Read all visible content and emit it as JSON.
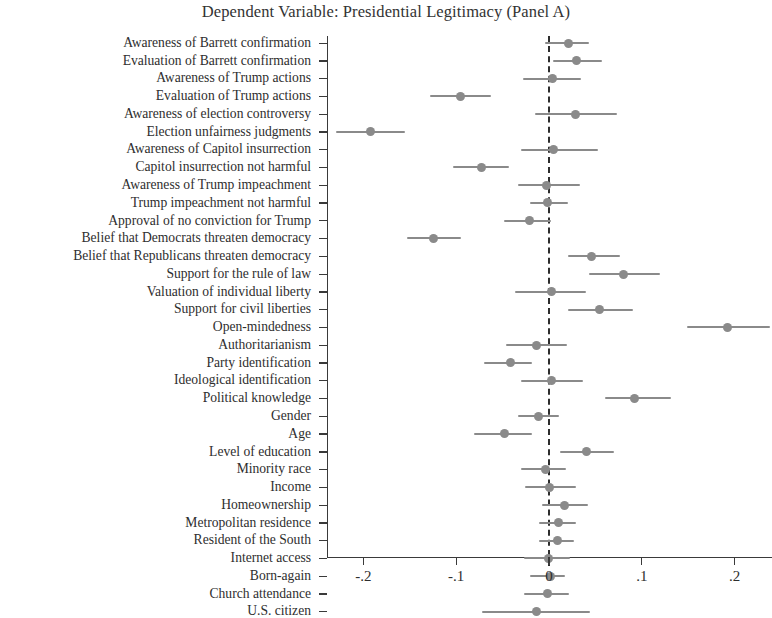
{
  "chart_data": {
    "type": "scatter",
    "title": "Dependent Variable: Presidential Legitimacy (Panel A)",
    "subtitle": "",
    "xlabel": "",
    "ylabel": "",
    "xlim": [
      -0.245,
      0.243
    ],
    "grid": false,
    "legend": null,
    "orientation": "horizontal",
    "reference_line": {
      "value": 0,
      "style": "dashed",
      "color": "#2d2d2d"
    },
    "marker_color": "#8a8a8a",
    "xticks": [
      -0.2,
      -0.1,
      0,
      0.1,
      0.2
    ],
    "xticklabels": [
      "-.2",
      "-.1",
      "0",
      ".1",
      ".2"
    ],
    "categories": [
      "Awareness of Barrett confirmation",
      "Evaluation of Barrett confirmation",
      "Awareness of Trump actions",
      "Evaluation of Trump actions",
      "Awareness of election controversy",
      "Election unfairness judgments",
      "Awareness of Capitol insurrection",
      "Capitol insurrection not harmful",
      "Awareness of Trump impeachment",
      "Trump impeachment not harmful",
      "Approval of no conviction for Trump",
      "Belief that Democrats threaten democracy",
      "Belief that Republicans threaten democracy",
      "Support for the rule of law",
      "Valuation of individual liberty",
      "Support for civil liberties",
      "Open-mindedness",
      "Authoritarianism",
      "Party identification",
      "Ideological identification",
      "Political knowledge",
      "Gender",
      "Age",
      "Level of education",
      "Minority race",
      "Income",
      "Homeownership",
      "Metropolitan residence",
      "Resident of the South",
      "Internet access",
      "Born-again",
      "Church attendance",
      "U.S. citizen"
    ],
    "values": [
      0.021,
      0.03,
      0.004,
      -0.095,
      0.029,
      -0.192,
      0.005,
      -0.073,
      -0.003,
      -0.002,
      -0.021,
      -0.124,
      0.046,
      0.08,
      0.003,
      0.054,
      0.192,
      -0.013,
      -0.042,
      0.003,
      0.092,
      -0.011,
      -0.048,
      0.04,
      -0.004,
      0.001,
      0.017,
      0.01,
      0.009,
      -0.001,
      0.002,
      -0.002,
      -0.013
    ],
    "ci_low": [
      -0.004,
      0.004,
      -0.028,
      -0.128,
      -0.015,
      -0.229,
      -0.03,
      -0.103,
      -0.033,
      -0.02,
      -0.048,
      -0.153,
      0.02,
      0.043,
      -0.037,
      0.021,
      0.149,
      -0.046,
      -0.07,
      -0.03,
      0.06,
      -0.033,
      -0.081,
      0.012,
      -0.03,
      -0.026,
      -0.008,
      -0.011,
      -0.011,
      -0.027,
      -0.021,
      -0.027,
      -0.072
    ],
    "ci_high": [
      0.043,
      0.057,
      0.034,
      -0.063,
      0.073,
      -0.155,
      0.053,
      -0.043,
      0.033,
      0.02,
      0.002,
      -0.095,
      0.077,
      0.12,
      0.04,
      0.09,
      0.238,
      0.019,
      -0.018,
      0.037,
      0.132,
      0.011,
      -0.018,
      0.07,
      0.018,
      0.029,
      0.042,
      0.029,
      0.027,
      0.023,
      0.017,
      0.022,
      0.044
    ]
  }
}
